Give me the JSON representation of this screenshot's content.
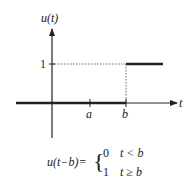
{
  "diagram": {
    "y_axis_label": "u(t)",
    "x_axis_label": "t",
    "y_tick_label": "1",
    "x_tick_labels": [
      "a",
      "b"
    ],
    "formula": {
      "lhs": "u(t−b)=",
      "cases": [
        {
          "value": "0",
          "condition": "t < b"
        },
        {
          "value": "1",
          "condition": "t ≥ b"
        }
      ]
    },
    "colors": {
      "line": "#222222",
      "dotted": "#555555",
      "background": "#ffffff"
    }
  }
}
